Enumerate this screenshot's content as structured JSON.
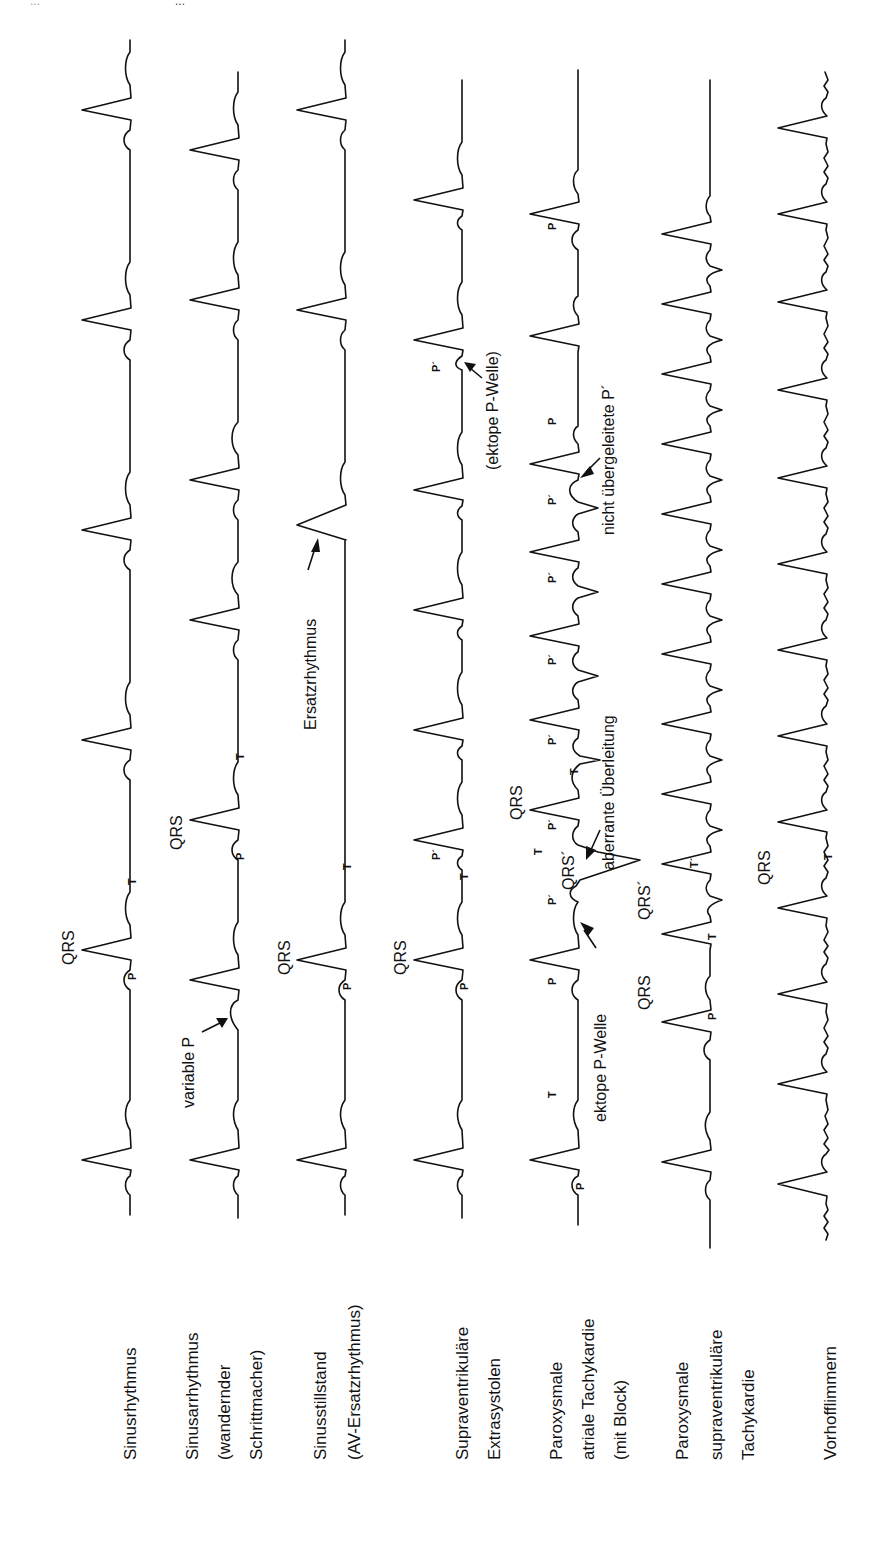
{
  "header": {
    "page_number": "...",
    "title": "..."
  },
  "orientation": "rotated-90-ccw",
  "rows": [
    {
      "id": "sinusrhythmus",
      "label_lines": [
        "Sinusrhythmus"
      ]
    },
    {
      "id": "sinusarrhythmus",
      "label_lines": [
        "Sinusarrhythmus",
        "(wandernder",
        "Schrittmacher)"
      ]
    },
    {
      "id": "sinusstillstand",
      "label_lines": [
        "Sinusstillstand",
        "(AV-Ersatzrhythmus)"
      ]
    },
    {
      "id": "sves",
      "label_lines": [
        "Supraventrikuläre",
        "Extrasystolen"
      ]
    },
    {
      "id": "pat",
      "label_lines": [
        "Paroxysmale",
        "atriale Tachykardie",
        "(mit Block)"
      ]
    },
    {
      "id": "psvt",
      "label_lines": [
        "Paroxysmale",
        "supraventrikuläre",
        "Tachykardie"
      ]
    },
    {
      "id": "vorhofflimmern",
      "label_lines": [
        "Vorhofflimmern"
      ]
    }
  ],
  "annotations": {
    "qrs": "QRS",
    "qrs_prime": "QRS´",
    "p": "P",
    "p_prime": "P´",
    "t": "T",
    "t_prime": "T´",
    "variable_p": "variable P",
    "ersatzrhythmus": "Ersatzrhythmus",
    "ektope_p_welle_paren": "(ektope P-Welle)",
    "ektope_p_welle": "ektope P-Welle",
    "aberrante_ueberleitung": "aberrante Überleitung",
    "nicht_uebergeleitete_p": "nicht übergeleitete P´"
  }
}
